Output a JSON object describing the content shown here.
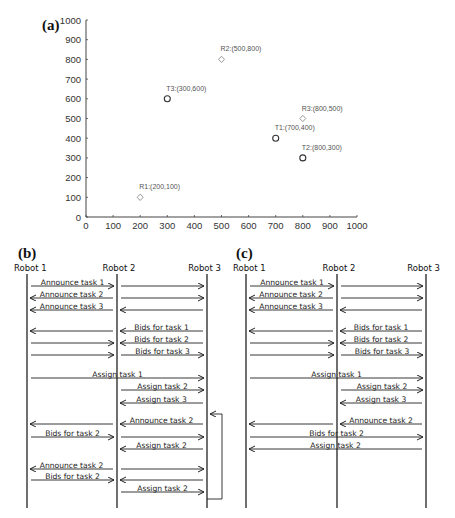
{
  "panel_a": {
    "label": "(a)",
    "chart_data": {
      "type": "scatter",
      "title": "",
      "xlabel": "",
      "ylabel": "",
      "xlim": [
        0,
        1000
      ],
      "ylim": [
        0,
        1000
      ],
      "x_ticks": [
        0,
        100,
        200,
        300,
        400,
        500,
        600,
        700,
        800,
        900,
        1000
      ],
      "y_ticks": [
        0,
        100,
        200,
        300,
        400,
        500,
        600,
        700,
        800,
        900,
        1000
      ],
      "grid": false,
      "series": [
        {
          "name": "Robots",
          "marker": "diamond",
          "color": "#9a9a9a",
          "points": [
            {
              "label": "R1:(200,100)",
              "x": 200,
              "y": 100
            },
            {
              "label": "R2:(500,800)",
              "x": 500,
              "y": 800
            },
            {
              "label": "R3:(800,500)",
              "x": 800,
              "y": 500
            }
          ]
        },
        {
          "name": "Tasks",
          "marker": "circle",
          "color": "#333333",
          "points": [
            {
              "label": "T1:(700,400)",
              "x": 700,
              "y": 400
            },
            {
              "label": "T2:(800,300)",
              "x": 800,
              "y": 300
            },
            {
              "label": "T3:(300,600)",
              "x": 300,
              "y": 600
            }
          ]
        }
      ]
    }
  },
  "panel_b": {
    "label": "(b)",
    "robots": [
      "Robot 1",
      "Robot 2",
      "Robot 3"
    ],
    "messages": [
      {
        "y": 286,
        "from": 0,
        "to": 1,
        "text": "Announce task 1"
      },
      {
        "y": 286,
        "from": 1,
        "to": 2,
        "text": ""
      },
      {
        "y": 298,
        "from": 1,
        "to": 0,
        "text": "Announce task 2"
      },
      {
        "y": 298,
        "from": 1,
        "to": 2,
        "text": ""
      },
      {
        "y": 310,
        "from": 1,
        "to": 0,
        "text": "Announce task 3"
      },
      {
        "y": 310,
        "from": 2,
        "to": 1,
        "text": ""
      },
      {
        "y": 331,
        "from": 1,
        "to": 0,
        "text": ""
      },
      {
        "y": 331,
        "from": 2,
        "to": 1,
        "text": "Bids for task 1"
      },
      {
        "y": 343,
        "from": 0,
        "to": 1,
        "text": ""
      },
      {
        "y": 343,
        "from": 2,
        "to": 1,
        "text": "Bids for task 2"
      },
      {
        "y": 355,
        "from": 0,
        "to": 1,
        "text": ""
      },
      {
        "y": 355,
        "from": 1,
        "to": 2,
        "text": "Bids for task 3"
      },
      {
        "y": 378,
        "from": 0,
        "to": 2,
        "text": "Assign task 1"
      },
      {
        "y": 390,
        "from": 1,
        "to": 2,
        "text": "Assign task 2"
      },
      {
        "y": 403,
        "from": 2,
        "to": 1,
        "text": "Assign task 3"
      },
      {
        "y": 424,
        "from": 1,
        "to": 0,
        "text": ""
      },
      {
        "y": 424,
        "from": 2,
        "to": 1,
        "text": "Announce task 2"
      },
      {
        "y": 437,
        "from": 0,
        "to": 1,
        "text": "Bids for task 2"
      },
      {
        "y": 437,
        "from": 1,
        "to": 2,
        "text": ""
      },
      {
        "y": 449,
        "from": 2,
        "to": 1,
        "text": "Assign task 2"
      },
      {
        "y": 469,
        "from": 1,
        "to": 0,
        "text": "Announce task 2"
      },
      {
        "y": 469,
        "from": 1,
        "to": 2,
        "text": ""
      },
      {
        "y": 480,
        "from": 0,
        "to": 1,
        "text": "Bids for task 2"
      },
      {
        "y": 480,
        "from": 2,
        "to": 1,
        "text": ""
      },
      {
        "y": 492,
        "from": 1,
        "to": 2,
        "text": "Assign task 2"
      }
    ],
    "loop_bracket": {
      "y_top": 414,
      "y_bottom": 499
    }
  },
  "panel_c": {
    "label": "(c)",
    "robots": [
      "Robot 1",
      "Robot 2",
      "Robot 3"
    ],
    "messages": [
      {
        "y": 286,
        "from": 0,
        "to": 1,
        "text": "Announce task 1"
      },
      {
        "y": 286,
        "from": 1,
        "to": 2,
        "text": ""
      },
      {
        "y": 298,
        "from": 1,
        "to": 0,
        "text": "Announce task 2"
      },
      {
        "y": 298,
        "from": 1,
        "to": 2,
        "text": ""
      },
      {
        "y": 310,
        "from": 1,
        "to": 0,
        "text": "Announce task 3"
      },
      {
        "y": 310,
        "from": 2,
        "to": 1,
        "text": ""
      },
      {
        "y": 331,
        "from": 1,
        "to": 0,
        "text": ""
      },
      {
        "y": 331,
        "from": 2,
        "to": 1,
        "text": "Bids for task 1"
      },
      {
        "y": 343,
        "from": 0,
        "to": 1,
        "text": ""
      },
      {
        "y": 343,
        "from": 2,
        "to": 1,
        "text": "Bids for task 2"
      },
      {
        "y": 355,
        "from": 0,
        "to": 1,
        "text": ""
      },
      {
        "y": 355,
        "from": 1,
        "to": 2,
        "text": "Bids for task 3"
      },
      {
        "y": 378,
        "from": 0,
        "to": 2,
        "text": "Assign task 1"
      },
      {
        "y": 390,
        "from": 1,
        "to": 2,
        "text": "Assign task 2"
      },
      {
        "y": 403,
        "from": 2,
        "to": 1,
        "text": "Assign task 3"
      },
      {
        "y": 424,
        "from": 1,
        "to": 0,
        "text": ""
      },
      {
        "y": 424,
        "from": 2,
        "to": 1,
        "text": "Announce task 2"
      },
      {
        "y": 437,
        "from": 0,
        "to": 2,
        "text": "Bids for task 2"
      },
      {
        "y": 449,
        "from": 2,
        "to": 0,
        "text": "Assign task 2"
      }
    ]
  }
}
